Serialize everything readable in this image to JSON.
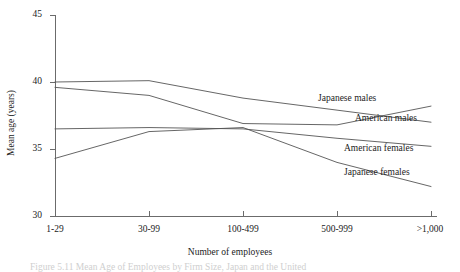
{
  "chart_data": {
    "type": "line",
    "title": "",
    "xlabel": "Number of employees",
    "ylabel": "Mean age (years)",
    "categories": [
      "1-29",
      "30-99",
      "100-499",
      "500-999",
      ">1,000"
    ],
    "ylim": [
      30,
      45
    ],
    "yticks": [
      30,
      35,
      40,
      45
    ],
    "grid": false,
    "legend_position": "inline-right-of-lines",
    "series": [
      {
        "name": "Japanese males",
        "values": [
          40.0,
          40.1,
          38.8,
          37.9,
          37.0
        ]
      },
      {
        "name": "American males",
        "values": [
          39.6,
          39.0,
          36.9,
          36.8,
          38.2
        ]
      },
      {
        "name": "American females",
        "values": [
          36.5,
          36.6,
          36.5,
          35.8,
          35.2
        ]
      },
      {
        "name": "Japanese females",
        "values": [
          34.3,
          36.3,
          36.6,
          34.0,
          32.2
        ]
      }
    ]
  },
  "axes": {
    "y_title": "Mean age (years)",
    "x_title": "Number of employees",
    "y_tick_labels": [
      "45",
      "40",
      "35",
      "30"
    ],
    "x_tick_labels": [
      "1-29",
      "30-99",
      "100-499",
      "500-999",
      ">1,000"
    ]
  },
  "series_labels": {
    "japanese_males": "Japanese males",
    "american_males": "American males",
    "american_females": "American females",
    "japanese_females": "Japanese females"
  },
  "caption": {
    "text": "Figure 5.11   Mean Age of Employees by Firm Size, Japan and the United"
  },
  "colors": {
    "axis": "#6b6b6b",
    "line": "#555555",
    "text": "#1c1c1c",
    "background": "#ffffff"
  }
}
